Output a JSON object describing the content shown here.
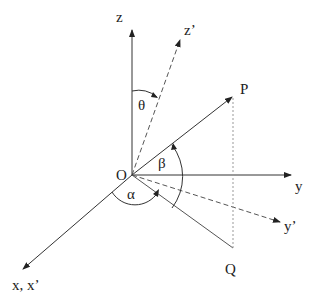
{
  "diagram": {
    "type": "3d-coordinate-rotation",
    "origin": {
      "label": "O",
      "x": 132,
      "y": 175
    },
    "axes": [
      {
        "id": "z",
        "label": "z",
        "style": "solid",
        "end": [
          132,
          28
        ],
        "label_pos": [
          125,
          22
        ]
      },
      {
        "id": "z_prime",
        "label": "z’",
        "style": "dashed",
        "end": [
          181,
          38
        ],
        "label_pos": [
          185,
          36
        ]
      },
      {
        "id": "y",
        "label": "y",
        "style": "solid",
        "end": [
          292,
          175
        ],
        "label_pos": [
          295,
          194
        ]
      },
      {
        "id": "y_prime",
        "label": "y’",
        "style": "dashed",
        "end": [
          281,
          222
        ],
        "label_pos": [
          284,
          232
        ]
      },
      {
        "id": "x",
        "label": "x, x’",
        "style": "solid",
        "end": [
          22,
          270
        ],
        "label_pos": [
          12,
          292
        ]
      }
    ],
    "points": [
      {
        "id": "P",
        "label": "P",
        "x": 233,
        "y": 96,
        "label_pos": [
          241,
          94
        ]
      },
      {
        "id": "Q",
        "label": "Q",
        "x": 233,
        "y": 248,
        "label_pos": [
          225,
          274
        ]
      }
    ],
    "angles": [
      {
        "id": "theta",
        "label": "θ",
        "label_pos": [
          141,
          111
        ]
      },
      {
        "id": "beta",
        "label": "β",
        "label_pos": [
          160,
          168
        ]
      },
      {
        "id": "alpha",
        "label": "α",
        "label_pos": [
          128,
          200
        ]
      }
    ],
    "colors": {
      "line": "#333333",
      "dashed": "#666666",
      "dotted": "#999999"
    }
  }
}
